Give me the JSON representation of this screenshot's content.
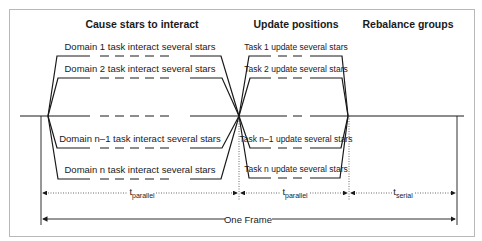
{
  "headings": {
    "phase1": "Cause stars to interact",
    "phase2": "Update positions",
    "phase3": "Rebalance groups"
  },
  "phase1_tasks": [
    "Domain 1 task interact several stars",
    "Domain 2 task interact several stars",
    "Domain n–1 task interact several stars",
    "Domain n task interact several stars"
  ],
  "phase2_tasks": [
    "Task 1 update several stars",
    "Task 2 update several stars",
    "Task n–1 update several stars",
    "Task n update several stars"
  ],
  "timings": {
    "t1": {
      "base": "t",
      "sub": "parallel"
    },
    "t2": {
      "base": "t",
      "sub": "parallel"
    },
    "t3": {
      "base": "t",
      "sub": "serial"
    }
  },
  "frame_label": "One Frame",
  "colors": {
    "line": "#1a1a1a",
    "border": "#b8b8b8",
    "background": "#ffffff"
  }
}
